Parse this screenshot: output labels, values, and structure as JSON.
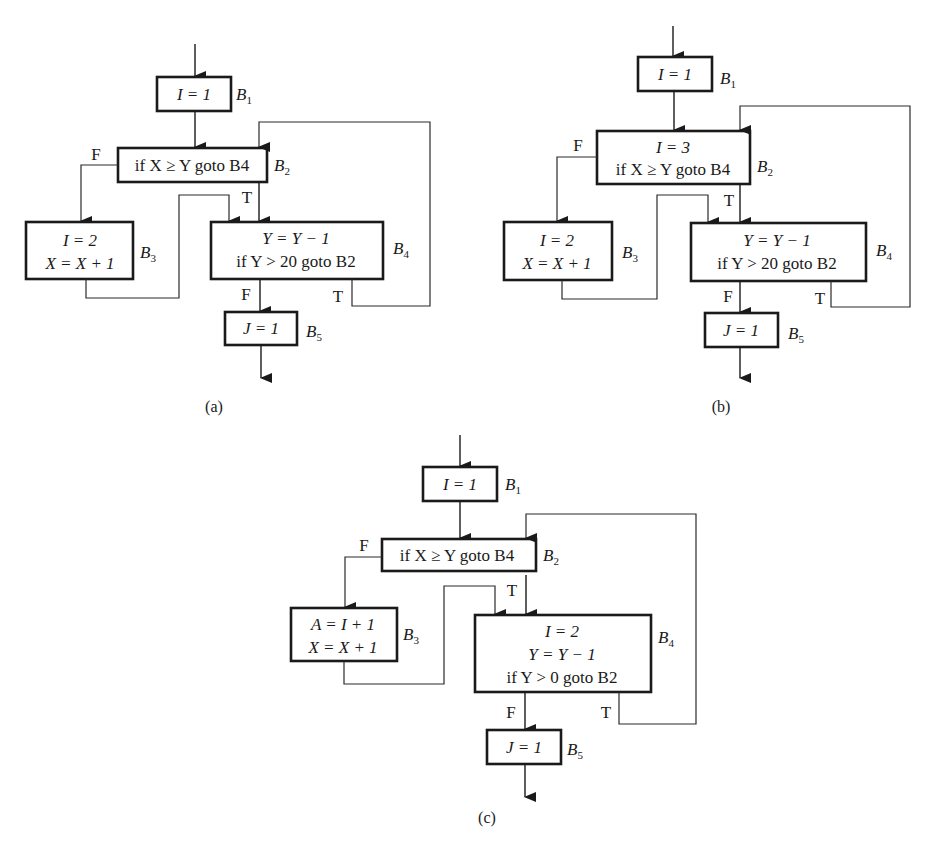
{
  "figure": {
    "panels": [
      {
        "id": "a",
        "caption": "(a)",
        "blocks": [
          {
            "name": "B1",
            "label": "B",
            "sub": "1",
            "lines": [
              "I = 1"
            ]
          },
          {
            "name": "B2",
            "label": "B",
            "sub": "2",
            "lines": [
              "if X ≥ Y goto B4"
            ]
          },
          {
            "name": "B3",
            "label": "B",
            "sub": "3",
            "lines": [
              "I = 2",
              "X = X + 1"
            ]
          },
          {
            "name": "B4",
            "label": "B",
            "sub": "4",
            "lines": [
              "Y = Y − 1",
              "if Y > 20 goto B2"
            ]
          },
          {
            "name": "B5",
            "label": "B",
            "sub": "5",
            "lines": [
              "J = 1"
            ]
          }
        ],
        "edge_labels": {
          "b2_false": "F",
          "b2_true": "T",
          "b4_false": "F",
          "b4_true": "T"
        }
      },
      {
        "id": "b",
        "caption": "(b)",
        "blocks": [
          {
            "name": "B1",
            "label": "B",
            "sub": "1",
            "lines": [
              "I = 1"
            ]
          },
          {
            "name": "B2",
            "label": "B",
            "sub": "2",
            "lines": [
              "I = 3",
              "if X ≥ Y goto B4"
            ]
          },
          {
            "name": "B3",
            "label": "B",
            "sub": "3",
            "lines": [
              "I = 2",
              "X = X + 1"
            ]
          },
          {
            "name": "B4",
            "label": "B",
            "sub": "4",
            "lines": [
              "Y = Y − 1",
              "if Y > 20 goto B2"
            ]
          },
          {
            "name": "B5",
            "label": "B",
            "sub": "5",
            "lines": [
              "J = 1"
            ]
          }
        ],
        "edge_labels": {
          "b2_false": "F",
          "b2_true": "T",
          "b4_false": "F",
          "b4_true": "T"
        }
      },
      {
        "id": "c",
        "caption": "(c)",
        "blocks": [
          {
            "name": "B1",
            "label": "B",
            "sub": "1",
            "lines": [
              "I = 1"
            ]
          },
          {
            "name": "B2",
            "label": "B",
            "sub": "2",
            "lines": [
              "if X ≥ Y goto B4"
            ]
          },
          {
            "name": "B3",
            "label": "B",
            "sub": "3",
            "lines": [
              "A = I + 1",
              "X = X + 1"
            ]
          },
          {
            "name": "B4",
            "label": "B",
            "sub": "4",
            "lines": [
              "I = 2",
              "Y = Y − 1",
              "if Y > 0 goto B2"
            ]
          },
          {
            "name": "B5",
            "label": "B",
            "sub": "5",
            "lines": [
              "J = 1"
            ]
          }
        ],
        "edge_labels": {
          "b2_false": "F",
          "b2_true": "T",
          "b4_false": "F",
          "b4_true": "T"
        }
      }
    ]
  }
}
